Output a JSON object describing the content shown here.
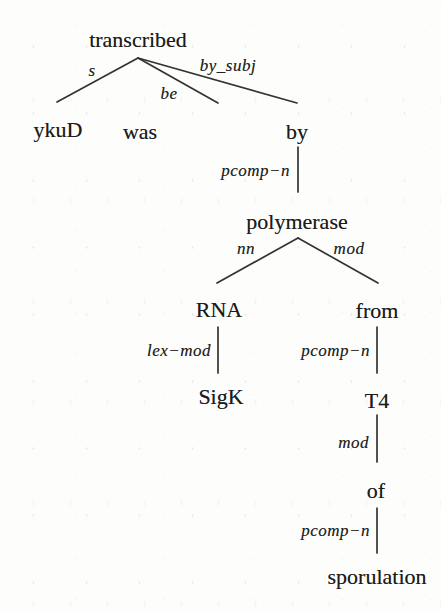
{
  "tree": {
    "description": "dependency parse tree",
    "nodes": [
      {
        "word": "transcribed"
      },
      {
        "word": "ykuD"
      },
      {
        "word": "was"
      },
      {
        "word": "by"
      },
      {
        "word": "polymerase"
      },
      {
        "word": "RNA"
      },
      {
        "word": "from"
      },
      {
        "word": "SigK"
      },
      {
        "word": "T4"
      },
      {
        "word": "of"
      },
      {
        "word": "sporulation"
      }
    ],
    "edges": [
      {
        "label": "s",
        "from": "transcribed",
        "to": "ykuD"
      },
      {
        "label": "be",
        "from": "transcribed",
        "to": "was"
      },
      {
        "label": "by_subj",
        "from": "transcribed",
        "to": "by"
      },
      {
        "label": "pcomp−n",
        "from": "by",
        "to": "polymerase"
      },
      {
        "label": "nn",
        "from": "polymerase",
        "to": "RNA"
      },
      {
        "label": "mod",
        "from": "polymerase",
        "to": "from"
      },
      {
        "label": "lex−mod",
        "from": "RNA",
        "to": "SigK"
      },
      {
        "label": "pcomp−n",
        "from": "from",
        "to": "T4"
      },
      {
        "label": "mod",
        "from": "T4",
        "to": "of"
      },
      {
        "label": "pcomp−n",
        "from": "of",
        "to": "sporulation"
      }
    ]
  }
}
